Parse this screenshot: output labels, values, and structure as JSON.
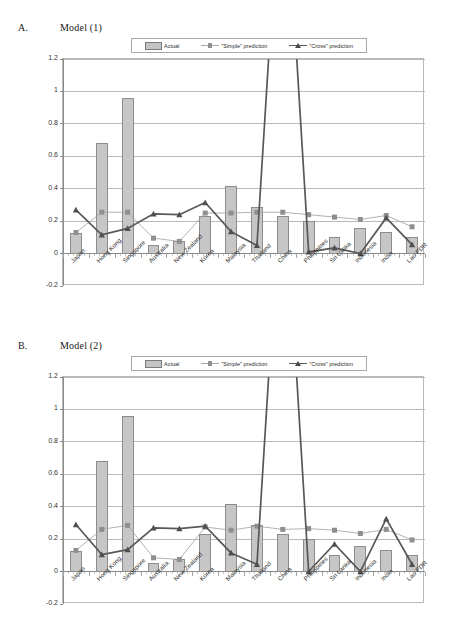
{
  "panels": [
    {
      "caption_letter": "A.",
      "caption_title": "Model (1)",
      "legend": [
        {
          "label": "Actual",
          "kind": "bar",
          "color": "#c6c6c6"
        },
        {
          "label": "\"Simple\" prediction",
          "kind": "line-square",
          "color": "#a9a9a9"
        },
        {
          "label": "\"Cross\" prediction",
          "kind": "line-triangle",
          "color": "#585858"
        }
      ]
    },
    {
      "caption_letter": "B.",
      "caption_title": "Model (2)",
      "legend": [
        {
          "label": "Actual",
          "kind": "bar",
          "color": "#c6c6c6"
        },
        {
          "label": "\"Simple\" prediction",
          "kind": "line-square",
          "color": "#a9a9a9"
        },
        {
          "label": "\"Cross\" prediction",
          "kind": "line-triangle",
          "color": "#585858"
        }
      ]
    }
  ],
  "chart_data": [
    {
      "type": "bar",
      "title": "Model (1)",
      "panel_label": "A.",
      "xlabel": "",
      "ylabel": "",
      "ylim": [
        -0.2,
        1.2
      ],
      "yticks": [
        -0.2,
        0,
        0.2,
        0.4,
        0.6,
        0.8,
        1,
        1.2
      ],
      "ytick_labels": [
        "-0.2",
        "0",
        "0.2",
        "0.4",
        "0.6",
        "0.8",
        "1",
        "1.2"
      ],
      "grid": true,
      "legend_position": "top-center",
      "categories": [
        "Japan",
        "Hong Kong",
        "Singapore",
        "Australia",
        "New Zealand",
        "Korea",
        "Malaysia",
        "Thailand",
        "China",
        "Philippines",
        "Sri Lanka",
        "Indonesia",
        "India",
        "Lao PDR"
      ],
      "series": [
        {
          "name": "Actual",
          "kind": "bar",
          "values": [
            0.125,
            0.68,
            0.96,
            0.055,
            0.075,
            0.23,
            0.415,
            0.29,
            0.23,
            0.2,
            0.1,
            0.16,
            0.135,
            0.1
          ]
        },
        {
          "name": "\"Simple\" prediction",
          "kind": "line",
          "values": [
            0.13,
            0.255,
            0.255,
            0.095,
            0.075,
            0.25,
            0.25,
            0.255,
            0.255,
            0.24,
            0.225,
            0.21,
            0.235,
            0.165
          ]
        },
        {
          "name": "\"Cross\" prediction",
          "kind": "line",
          "values": [
            0.27,
            0.115,
            0.155,
            0.245,
            0.24,
            0.315,
            0.135,
            0.05,
            2.6,
            0.01,
            0.035,
            0.0,
            0.22,
            0.055
          ],
          "note": "China value spikes far above the 1.2 axis maximum and is clipped by the plot frame"
        }
      ]
    },
    {
      "type": "bar",
      "title": "Model (2)",
      "panel_label": "B.",
      "xlabel": "",
      "ylabel": "",
      "ylim": [
        -0.2,
        1.2
      ],
      "yticks": [
        -0.2,
        0,
        0.2,
        0.4,
        0.6,
        0.8,
        1,
        1.2
      ],
      "ytick_labels": [
        "-0.2",
        "0",
        "0.2",
        "0.4",
        "0.6",
        "0.8",
        "1",
        "1.2"
      ],
      "grid": true,
      "legend_position": "top-center",
      "categories": [
        "Japan",
        "Hong Kong",
        "Singapore",
        "Australia",
        "New Zealand",
        "Korea",
        "Malaysia",
        "Thailand",
        "China",
        "Philippines",
        "Sri Lanka",
        "Indonesia",
        "India",
        "Lao PDR"
      ],
      "series": [
        {
          "name": "Actual",
          "kind": "bar",
          "values": [
            0.125,
            0.68,
            0.96,
            0.055,
            0.075,
            0.23,
            0.415,
            0.29,
            0.23,
            0.2,
            0.1,
            0.16,
            0.135,
            0.1
          ]
        },
        {
          "name": "\"Simple\" prediction",
          "kind": "line",
          "values": [
            0.13,
            0.26,
            0.285,
            0.085,
            0.075,
            0.275,
            0.255,
            0.28,
            0.26,
            0.265,
            0.255,
            0.235,
            0.26,
            0.195
          ]
        },
        {
          "name": "\"Cross\" prediction",
          "kind": "line",
          "values": [
            0.29,
            0.105,
            0.135,
            0.27,
            0.265,
            0.28,
            0.115,
            0.045,
            2.6,
            0.0,
            0.17,
            0.0,
            0.325,
            0.045
          ],
          "note": "China value spikes far above the 1.2 axis maximum and is clipped by the plot frame"
        }
      ]
    }
  ]
}
